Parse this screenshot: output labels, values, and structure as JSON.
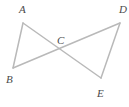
{
  "figure": {
    "kind": "geometry-diagram",
    "background_color": "#ffffff",
    "stroke_color": "#b9b9b9",
    "stroke_width": 1.5,
    "label_color": "#4a4a4a",
    "width": 129,
    "height": 107,
    "points": {
      "A": {
        "label": "A",
        "x": 23,
        "y": 23
      },
      "B": {
        "label": "B",
        "x": 13,
        "y": 68
      },
      "C": {
        "label": "C",
        "x": 62,
        "y": 50
      },
      "D": {
        "label": "D",
        "x": 120,
        "y": 23
      },
      "E": {
        "label": "E",
        "x": 101,
        "y": 78
      }
    },
    "segments": [
      {
        "name": "AB",
        "from": "A",
        "to": "B"
      },
      {
        "name": "AE",
        "from": "A",
        "to": "E"
      },
      {
        "name": "BD",
        "from": "B",
        "to": "D"
      },
      {
        "name": "DE",
        "from": "D",
        "to": "E"
      }
    ]
  }
}
